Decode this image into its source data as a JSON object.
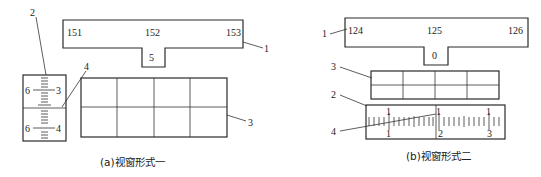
{
  "figure_a": {
    "caption": "(a)视窗形式一",
    "window_labels": [
      "151",
      "152",
      "153"
    ],
    "notch_label": "5",
    "scale_labels": {
      "upper_left": "6",
      "upper_right": "3",
      "lower_left": "6",
      "lower_right": "4"
    },
    "callouts": [
      "1",
      "2",
      "3",
      "4"
    ]
  },
  "figure_b": {
    "caption": "(b)视窗形式二",
    "window_labels": [
      "124",
      "125",
      "126"
    ],
    "notch_label": "0",
    "scale_top_labels": [
      "1",
      "1",
      "1"
    ],
    "scale_bottom_labels": [
      "1",
      "2",
      "3"
    ],
    "callouts": [
      "1",
      "2",
      "3",
      "4"
    ]
  }
}
